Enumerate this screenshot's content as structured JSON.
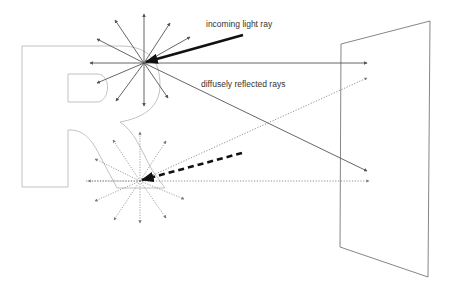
{
  "diagram": {
    "labels": {
      "incoming": "incoming light ray",
      "reflected": "diffusely reflected rays"
    },
    "elements": {
      "letter": "R",
      "surface": "screen panel",
      "upper_star": {
        "incoming_style": "solid",
        "ray_style": "solid",
        "ray_count": 12
      },
      "lower_star": {
        "incoming_style": "dashed",
        "ray_style": "dotted",
        "ray_count": 12
      }
    },
    "colors": {
      "ray": "#555555",
      "incoming": "#111111",
      "letter_outline": "#bbbbbb",
      "panel": "#777777",
      "text": "#333333"
    }
  }
}
